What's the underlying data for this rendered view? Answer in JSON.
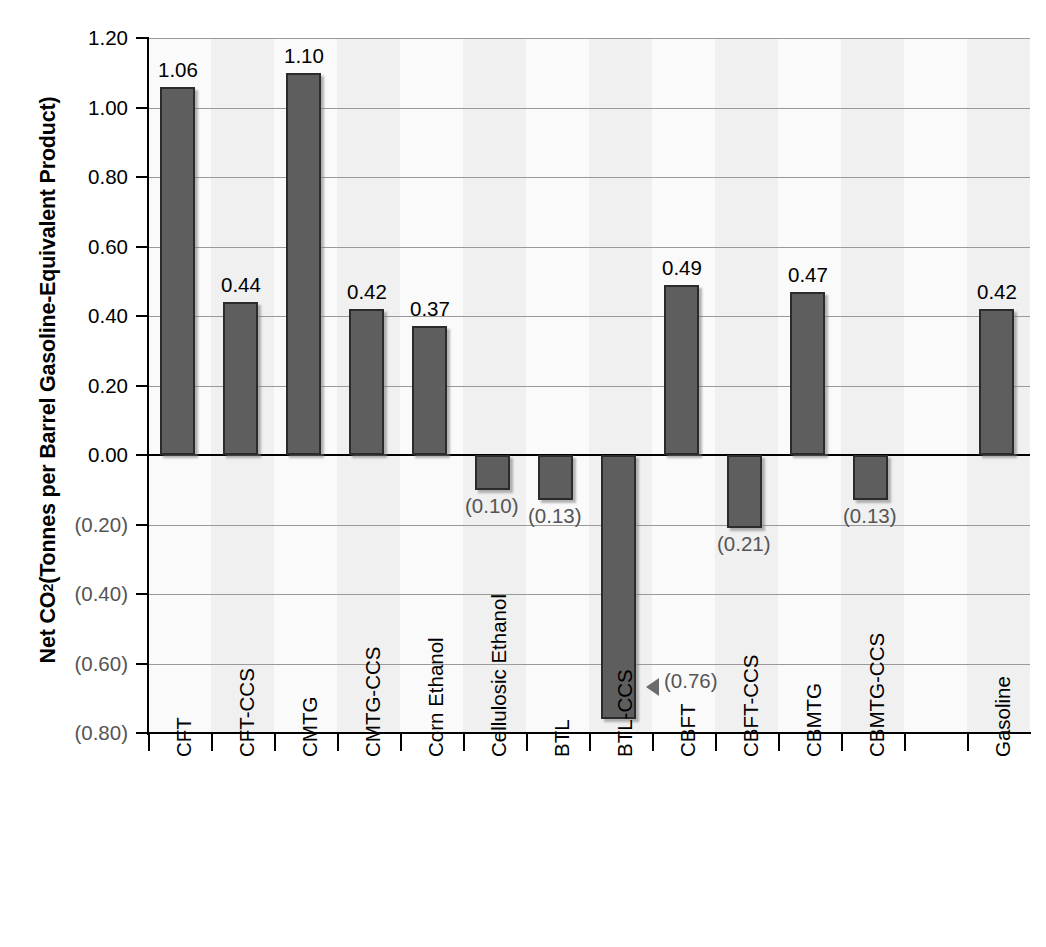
{
  "chart_data": {
    "type": "bar",
    "title": "",
    "xlabel": "",
    "ylabel": "Net CO2 (Tonnes per Barrel Gasoline-Equivalent Product)",
    "ylabel_parts": {
      "pre": "Net CO",
      "sub": "2",
      "post": " (Tonnes per Barrel Gasoline-Equivalent Product)"
    },
    "ylim": [
      -0.8,
      1.2
    ],
    "ytick_values": [
      1.2,
      1.0,
      0.8,
      0.6,
      0.4,
      0.2,
      0.0,
      -0.2,
      -0.4,
      -0.6,
      -0.8
    ],
    "ytick_labels": [
      "1.20",
      "1.00",
      "0.80",
      "0.60",
      "0.40",
      "0.20",
      "0.00",
      "(0.20)",
      "(0.40)",
      "(0.60)",
      "(0.80)"
    ],
    "grid": true,
    "legend": "none",
    "bar_color": "#5e5e5e",
    "bar_border_color": "#2b2b2b",
    "negative_label_color": "#555555",
    "positive_label_color": "#000000",
    "categories": [
      "CFT",
      "CFT-CCS",
      "CMTG",
      "CMTG-CCS",
      "Corn Ethanol",
      "Cellulosic Ethanol",
      "BTL",
      "BTL-CCS",
      "CBFT",
      "CBFT-CCS",
      "CBMTG",
      "CBMTG-CCS",
      "",
      "Gasoline"
    ],
    "values": [
      1.06,
      0.44,
      1.1,
      0.42,
      0.37,
      -0.1,
      -0.13,
      -0.76,
      0.49,
      -0.21,
      0.47,
      -0.13,
      null,
      0.42
    ],
    "value_labels": [
      "1.06",
      "0.44",
      "1.10",
      "0.42",
      "0.37",
      "(0.10)",
      "(0.13)",
      "(0.76)",
      "0.49",
      "(0.21)",
      "0.47",
      "(0.13)",
      "",
      "0.42"
    ],
    "annotations": [
      {
        "target_category": "BTL-CCS",
        "marker": "left-pointing-triangle",
        "label": "(0.76)"
      }
    ]
  },
  "caption": {
    "text": ""
  }
}
